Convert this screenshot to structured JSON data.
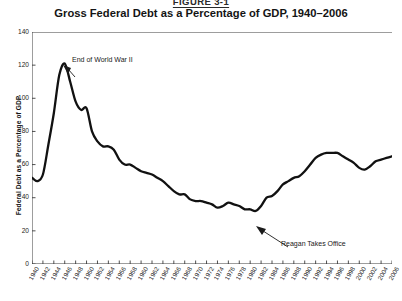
{
  "figure": {
    "label": "FIGURE 3-1",
    "title": "Gross Federal Debt as a Percentage of GDP, 1940–2006"
  },
  "axes": {
    "ylabel": "Federal Debt as a Percentage of GDP",
    "xlabel": "",
    "yticks": [
      "140",
      "120",
      "100",
      "80",
      "60",
      "40",
      "20",
      "0"
    ],
    "xticks": [
      "1940",
      "1942",
      "1944",
      "1946",
      "1948",
      "1950",
      "1952",
      "1954",
      "1956",
      "1958",
      "1960",
      "1962",
      "1964",
      "1966",
      "1968",
      "1970",
      "1972",
      "1974",
      "1976",
      "1978",
      "1980",
      "1982",
      "1984",
      "1986",
      "1988",
      "1990",
      "1992",
      "1994",
      "1996",
      "1998",
      "2000",
      "2002",
      "2004",
      "2006"
    ]
  },
  "annotations": [
    {
      "id": "wwii",
      "text": "End of World War II"
    },
    {
      "id": "reagan",
      "text": "Reagan Takes Office"
    }
  ],
  "colors": {
    "line": "#111111",
    "axis": "#3c3c3c",
    "text": "#1a1a1a",
    "background": "#ffffff"
  },
  "chart_data": {
    "type": "line",
    "title": "Gross Federal Debt as a Percentage of GDP, 1940–2006",
    "xlabel": "",
    "ylabel": "Federal Debt as a Percentage of GDP",
    "xlim": [
      1940,
      2006
    ],
    "ylim": [
      0,
      140
    ],
    "ytick_step": 20,
    "xtick_step": 2,
    "grid": false,
    "legend": false,
    "series": [
      {
        "name": "Gross Federal Debt (% of GDP)",
        "x": [
          1940,
          1941,
          1942,
          1943,
          1944,
          1945,
          1946,
          1947,
          1948,
          1949,
          1950,
          1951,
          1952,
          1953,
          1954,
          1955,
          1956,
          1957,
          1958,
          1959,
          1960,
          1961,
          1962,
          1963,
          1964,
          1965,
          1966,
          1967,
          1968,
          1969,
          1970,
          1971,
          1972,
          1973,
          1974,
          1975,
          1976,
          1977,
          1978,
          1979,
          1980,
          1981,
          1982,
          1983,
          1984,
          1985,
          1986,
          1987,
          1988,
          1989,
          1990,
          1991,
          1992,
          1993,
          1994,
          1995,
          1996,
          1997,
          1998,
          1999,
          2000,
          2001,
          2002,
          2003,
          2004,
          2005,
          2006
        ],
        "values": [
          52,
          50,
          54,
          72,
          91,
          114,
          121,
          110,
          98,
          93,
          94,
          80,
          74,
          71,
          71,
          69,
          63,
          60,
          60,
          58,
          56,
          55,
          54,
          52,
          50,
          47,
          44,
          42,
          42,
          39,
          38,
          38,
          37,
          36,
          34,
          35,
          37,
          36,
          35,
          33,
          33,
          32,
          35,
          40,
          41,
          44,
          48,
          50,
          52,
          53,
          56,
          60,
          64,
          66,
          67,
          67,
          67,
          65,
          63,
          61,
          58,
          57,
          59,
          62,
          63,
          64,
          65
        ]
      }
    ],
    "peak": {
      "year": 1946,
      "value": 121
    },
    "trough": {
      "year": 1981,
      "value": 32
    },
    "annotations": [
      {
        "text": "End of World War II",
        "year": 1946,
        "value": 121
      },
      {
        "text": "Reagan Takes Office",
        "year": 1981,
        "value": 32
      }
    ]
  }
}
